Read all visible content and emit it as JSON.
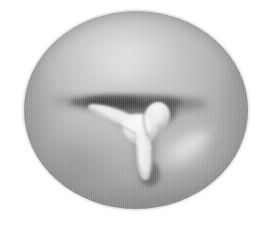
{
  "image": {
    "kind": "scientific-grayscale-render",
    "subject_label": "ellipsoidal-body-with-trilobed-invagination",
    "background_color": "#ffffff",
    "canvas": {
      "width": 264,
      "height": 227
    },
    "alt_text": "Grayscale shaded rendering of an ellipsoidal body with a dark horizontal fissure across the middle and a bright three-armed Y-shaped ridge at the center"
  },
  "body": {
    "name": "ellipsoid",
    "center_x": 136,
    "center_y": 110,
    "radius_x": 112,
    "radius_y": 99,
    "base_tone": "#a8a8a8",
    "highlight_tone": "#d6d6d6",
    "rim_tone": "#8e8e8e",
    "edge_tone": "#7c7c7c"
  },
  "fissure": {
    "name": "horizontal-dark-groove",
    "center_x": 132,
    "center_y": 103,
    "half_width": 72,
    "half_height": 11,
    "dark_tone": "#4e4e4e",
    "mid_tone": "#6f6f6f"
  },
  "tripod": {
    "name": "y-shaped-bright-ridge",
    "bright_tone": "#f2f2f2",
    "mid_tone": "#d2d2d2",
    "shadow_tone": "#5a5a5a",
    "arms": [
      {
        "label": "upper-left-arm",
        "from_x": 141,
        "from_y": 122,
        "to_x": 96,
        "to_y": 106
      },
      {
        "label": "upper-right-lobe",
        "from_x": 141,
        "from_y": 122,
        "to_x": 162,
        "to_y": 108
      },
      {
        "label": "lower-stem",
        "from_x": 141,
        "from_y": 122,
        "to_x": 148,
        "to_y": 172
      }
    ]
  },
  "highlights": [
    {
      "name": "lower-right-sheen",
      "cx": 182,
      "cy": 152,
      "rx": 34,
      "ry": 22,
      "tone": "#e0e0e0"
    },
    {
      "name": "upper-body-sheen",
      "cx": 126,
      "cy": 52,
      "rx": 62,
      "ry": 34,
      "tone": "#cfcfcf"
    }
  ],
  "shadows": [
    {
      "name": "lower-left-shade",
      "cx": 74,
      "cy": 168,
      "rx": 46,
      "ry": 38,
      "tone": "#8a8a8a"
    },
    {
      "name": "left-rim-shade",
      "cx": 34,
      "cy": 110,
      "rx": 22,
      "ry": 72,
      "tone": "#909090"
    },
    {
      "name": "bottom-rim-shade",
      "cx": 136,
      "cy": 200,
      "rx": 92,
      "ry": 20,
      "tone": "#8c8c8c"
    }
  ],
  "texture": {
    "name": "vertical-scanline-artifact",
    "orientation": "vertical",
    "period_px": 2,
    "strength": 0.085
  }
}
